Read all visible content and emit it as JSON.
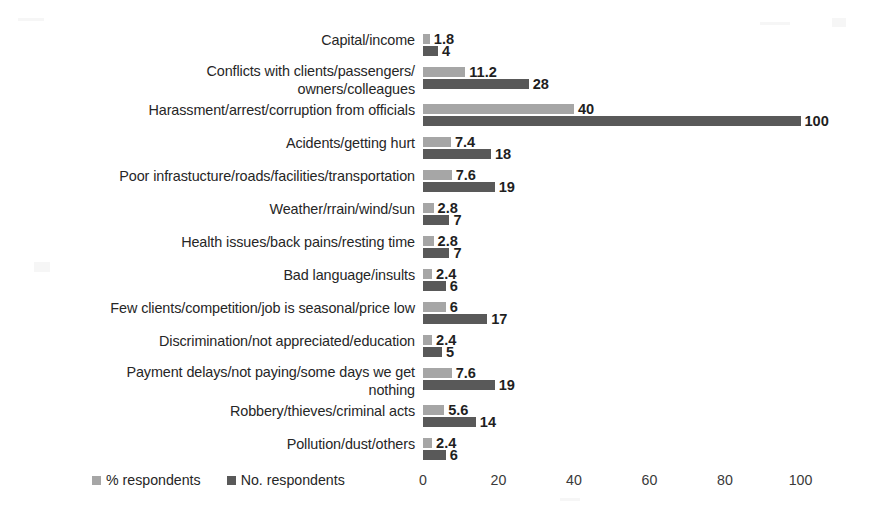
{
  "chart_data": {
    "type": "bar",
    "orientation": "horizontal",
    "title": "",
    "xlabel": "",
    "ylabel": "",
    "xlim": [
      0,
      110
    ],
    "grid": false,
    "legend_position": "bottom-left",
    "axis_ticks": [
      0,
      20,
      40,
      60,
      80,
      100
    ],
    "categories": [
      "Capital/income",
      "Conflicts with clients/passengers/\nowners/colleagues",
      "Harassment/arrest/corruption from officials",
      "Acidents/getting hurt",
      "Poor infrastucture/roads/facilities/transportation",
      "Weather/rrain/wind/sun",
      "Health issues/back pains/resting time",
      "Bad language/insults",
      "Few clients/competition/job is seasonal/price low",
      "Discrimination/not appreciated/education",
      "Payment delays/not paying/some days we get\nnothing",
      "Robbery/thieves/criminal acts",
      "Pollution/dust/others"
    ],
    "series": [
      {
        "name": "% respondents",
        "color": "#a6a6a6",
        "values": [
          1.8,
          11.2,
          40,
          7.4,
          7.6,
          2.8,
          2.8,
          2.4,
          6,
          2.4,
          7.6,
          5.6,
          2.4
        ],
        "labels": [
          "1.8",
          "11.2",
          "40",
          "7.4",
          "7.6",
          "2.8",
          "2.8",
          "2.4",
          "6",
          "2.4",
          "7.6",
          "5.6",
          "2.4"
        ]
      },
      {
        "name": "No. respondents",
        "color": "#595959",
        "values": [
          4,
          28,
          100,
          18,
          19,
          7,
          7,
          6,
          17,
          5,
          19,
          14,
          6
        ],
        "labels": [
          "4",
          "28",
          "100",
          "18",
          "19",
          "7",
          "7",
          "6",
          "17",
          "5",
          "19",
          "14",
          "6"
        ]
      }
    ]
  },
  "legend": {
    "items": [
      {
        "label": "% respondents",
        "color": "#a6a6a6"
      },
      {
        "label": "No. respondents",
        "color": "#595959"
      }
    ]
  },
  "axis": {
    "ticks": [
      "0",
      "20",
      "40",
      "60",
      "80",
      "100"
    ]
  }
}
